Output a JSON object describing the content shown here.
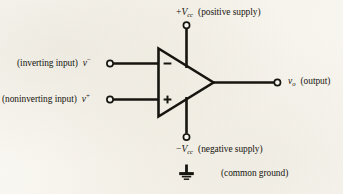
{
  "diagram": {
    "background_color": "#f7f5f0",
    "ink_color": "#17150f"
  },
  "terminals": {
    "inverting_input": {
      "description_label": "(inverting input)",
      "symbol_var": "v",
      "symbol_sign": "−",
      "polarity_mark": "−"
    },
    "noninverting_input": {
      "description_label": "(noninverting input)",
      "symbol_var": "v",
      "symbol_sign": "+",
      "polarity_mark": "+"
    },
    "output": {
      "description_label": "(output)",
      "symbol_var": "v",
      "symbol_sub": "o"
    },
    "positive_supply": {
      "description_label": "(positive supply)",
      "symbol_sign": "+",
      "symbol_var": "V",
      "symbol_sub": "cc"
    },
    "negative_supply": {
      "description_label": "(negative supply)",
      "symbol_sign": "−",
      "symbol_var": "V",
      "symbol_sub": "cc"
    },
    "common_ground": {
      "description_label": "(common ground)",
      "icon": "ground-icon"
    }
  }
}
